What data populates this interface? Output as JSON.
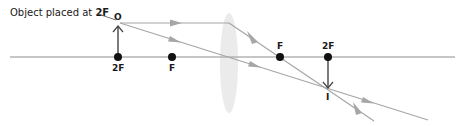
{
  "caption": {
    "text": "Object placed at ",
    "emphasis": "2F"
  },
  "labels": {
    "object": "O",
    "image": "I",
    "left_2f": "2F",
    "left_f": "F",
    "right_f": "F",
    "right_2f": "2F"
  },
  "colors": {
    "axis": "#b3b3b3",
    "ray": "#a6a6a6",
    "arrowhead": "#a6a6a6",
    "lens": "#ebebeb",
    "point": "#111111",
    "object_arrow": "#444444"
  },
  "geometry": {
    "axis_y": 57,
    "lens_x": 229,
    "object_x": 118,
    "object_top_y": 22,
    "image_x": 329,
    "image_bottom_y": 89,
    "focal_points_x": [
      172,
      280
    ],
    "double_focal_points_x": [
      118,
      328
    ]
  }
}
